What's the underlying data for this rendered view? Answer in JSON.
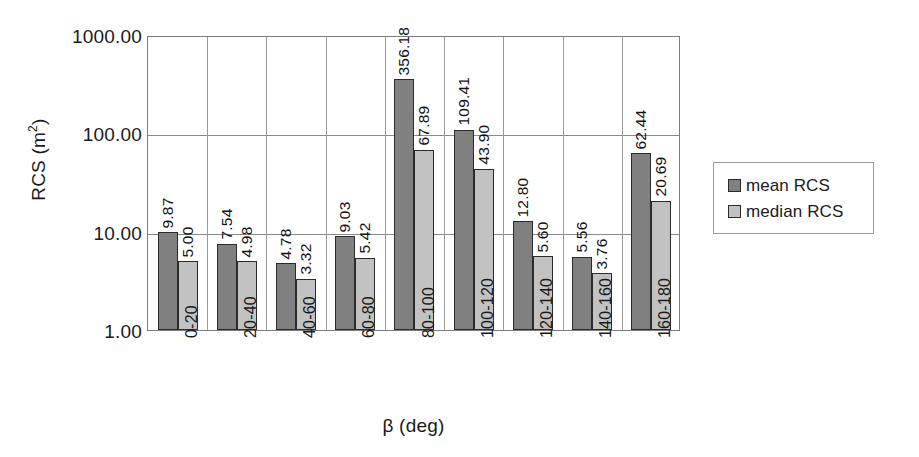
{
  "chart_data": {
    "type": "bar",
    "title": "",
    "xlabel": "β (deg)",
    "ylabel": "RCS (m²)",
    "ylabel_base": "RCS (m",
    "ylabel_exp": "2",
    "ylabel_tail": ")",
    "yscale": "log",
    "ylim": [
      1,
      1000
    ],
    "grid": true,
    "legend_position": "right",
    "categories": [
      "0-20",
      "20-40",
      "40-60",
      "60-80",
      "80-100",
      "100-120",
      "120-140",
      "140-160",
      "160-180"
    ],
    "ytick_labels": [
      "1000.00",
      "100.00",
      "10.00",
      "1.00"
    ],
    "ytick_values": [
      1000,
      100,
      10,
      1
    ],
    "series": [
      {
        "name": "mean RCS",
        "color": "#808080",
        "values": [
          9.87,
          7.54,
          4.78,
          9.03,
          356.18,
          109.41,
          12.8,
          5.56,
          62.44
        ],
        "labels": [
          "9.87",
          "7.54",
          "4.78",
          "9.03",
          "356.18",
          "109.41",
          "12.80",
          "5.56",
          "62.44"
        ]
      },
      {
        "name": "median RCS",
        "color": "#c2c2c2",
        "values": [
          5.0,
          4.98,
          3.32,
          5.42,
          67.89,
          43.9,
          5.6,
          3.76,
          20.69
        ],
        "labels": [
          "5.00",
          "4.98",
          "3.32",
          "5.42",
          "67.89",
          "43.90",
          "5.60",
          "3.76",
          "20.69"
        ]
      }
    ]
  },
  "legend": {
    "items": [
      {
        "label": "mean RCS",
        "color": "#808080"
      },
      {
        "label": "median RCS",
        "color": "#c2c2c2"
      }
    ]
  },
  "colors": {
    "mean": "#808080",
    "median": "#c2c2c2",
    "grid": "#8a8a8a",
    "axis": "#7d7d7d",
    "bar_outline": "#2b2b2b"
  }
}
